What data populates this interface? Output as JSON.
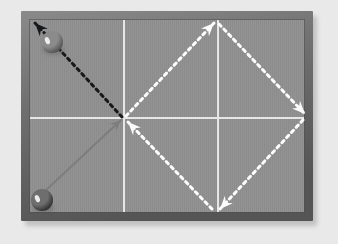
{
  "scene": {
    "title": "Pool table cue-ball deflection diagram",
    "canvas": {
      "width": 338,
      "height": 244
    },
    "background_color": "#e9e9e9"
  },
  "table": {
    "name": "pool-table",
    "rail_color": "#6e6e6e",
    "rail_highlight_color": "#8a8a8a",
    "rail_shadow_color": "#555555",
    "felt_color": "#939393",
    "felt_texture_color": "#8c8c8c",
    "outer": {
      "x": 21,
      "y": 11,
      "width": 292,
      "height": 210
    },
    "rail_thickness": 9,
    "felt": {
      "x": 30,
      "y": 20,
      "width": 274,
      "height": 192
    }
  },
  "grid": {
    "name": "table-grid",
    "line_color": "#e6e6e6",
    "line_width": 2,
    "vertical_lines_x": [
      124,
      218
    ],
    "horizontal_lines_y": [
      118
    ]
  },
  "balls": [
    {
      "name": "cue-ball-upper",
      "label": "ball-upper-left",
      "cx": 52,
      "cy": 42,
      "r": 11,
      "base_color": "#8b8b8b",
      "shade_color": "#4a4a4a",
      "highlight_color": "#f2f2f2"
    },
    {
      "name": "cue-ball-lower",
      "label": "ball-lower-left",
      "cx": 42,
      "cy": 200,
      "r": 11,
      "base_color": "#6e6e6e",
      "shade_color": "#262626",
      "highlight_color": "#f0f0f0"
    }
  ],
  "center_point": {
    "x": 124,
    "y": 118
  },
  "vectors": [
    {
      "name": "incoming-approach-vector",
      "style": "solid",
      "color": "#7d7d7d",
      "from": {
        "x": 44,
        "y": 192
      },
      "to": {
        "x": 121,
        "y": 120
      },
      "arrowhead": "at-end",
      "width": 2
    },
    {
      "name": "deflection-vector-upper-left",
      "style": "dotted",
      "color": "#16181a",
      "from": {
        "x": 122,
        "y": 117
      },
      "to": {
        "x": 35,
        "y": 23
      },
      "arrowhead": "at-end",
      "width": 3,
      "dot_spacing": 6
    },
    {
      "name": "diamond-vector-center-to-top",
      "style": "dotted",
      "color": "#fdfdfd",
      "from": {
        "x": 126,
        "y": 116
      },
      "to": {
        "x": 214,
        "y": 23
      },
      "arrowhead": "at-end",
      "width": 3,
      "dot_spacing": 6
    },
    {
      "name": "diamond-vector-top-to-right",
      "style": "dotted",
      "color": "#fdfdfd",
      "from": {
        "x": 219,
        "y": 24
      },
      "to": {
        "x": 305,
        "y": 114
      },
      "arrowhead": "at-end",
      "width": 3,
      "dot_spacing": 6
    },
    {
      "name": "diamond-vector-right-to-bottom",
      "style": "dotted",
      "color": "#fdfdfd",
      "from": {
        "x": 303,
        "y": 120
      },
      "to": {
        "x": 220,
        "y": 209
      },
      "arrowhead": "at-end",
      "width": 3,
      "dot_spacing": 6
    },
    {
      "name": "diamond-vector-bottom-to-center",
      "style": "dotted",
      "color": "#fdfdfd",
      "from": {
        "x": 212,
        "y": 209
      },
      "to": {
        "x": 128,
        "y": 122
      },
      "arrowhead": "at-end",
      "width": 3,
      "dot_spacing": 6
    }
  ],
  "arrowheads": [
    {
      "name": "arrowhead-upper-left",
      "x": 35,
      "y": 23,
      "angle": -133,
      "color": "#16181a",
      "size": 13
    },
    {
      "name": "arrowhead-diamond-top",
      "x": 214,
      "y": 23,
      "angle": -46,
      "color": "#fdfdfd",
      "size": 13
    },
    {
      "name": "arrowhead-diamond-right",
      "x": 305,
      "y": 114,
      "angle": 46,
      "color": "#fdfdfd",
      "size": 13
    },
    {
      "name": "arrowhead-diamond-bottom",
      "x": 220,
      "y": 209,
      "angle": 133,
      "color": "#fdfdfd",
      "size": 13
    },
    {
      "name": "arrowhead-diamond-center",
      "x": 128,
      "y": 122,
      "angle": -134,
      "color": "#fdfdfd",
      "size": 13
    },
    {
      "name": "arrowhead-approach-center",
      "x": 121,
      "y": 120,
      "angle": -43,
      "color": "#7d7d7d",
      "size": 11
    }
  ]
}
